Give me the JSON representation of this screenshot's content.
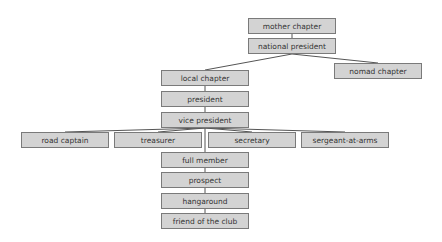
{
  "diagram": {
    "type": "org-chart",
    "nodes": {
      "mother_chapter": "mother chapter",
      "national_president": "national president",
      "local_chapter": "local chapter",
      "nomad_chapter": "nomad chapter",
      "president": "president",
      "vice_president": "vice president",
      "road_captain": "road captain",
      "treasurer": "treasurer",
      "secretary": "secretary",
      "sergeant_at_arms": "sergeant-at-arms",
      "full_member": "full member",
      "prospect": "prospect",
      "hangaround": "hangaround",
      "friend_of_the_club": "friend of the club"
    },
    "edges": [
      [
        "mother chapter",
        "national president"
      ],
      [
        "national president",
        "local chapter"
      ],
      [
        "national president",
        "nomad chapter"
      ],
      [
        "local chapter",
        "president"
      ],
      [
        "president",
        "vice president"
      ],
      [
        "vice president",
        "road captain"
      ],
      [
        "vice president",
        "treasurer"
      ],
      [
        "vice president",
        "secretary"
      ],
      [
        "vice president",
        "sergeant-at-arms"
      ],
      [
        "vice president",
        "full member"
      ],
      [
        "full member",
        "prospect"
      ],
      [
        "prospect",
        "hangaround"
      ],
      [
        "hangaround",
        "friend of the club"
      ]
    ],
    "colors": {
      "node_fill": "#d3d3d3",
      "node_border": "#7a7a7a",
      "connector": "#555555",
      "text": "#333333"
    }
  }
}
